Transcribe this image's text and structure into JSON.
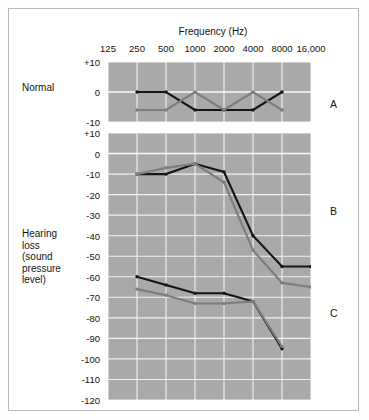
{
  "figure": {
    "background_color": "#ffffff",
    "plot_background_color": "#a9a9a9",
    "border_color": "#b9b9b9"
  },
  "labels": {
    "normal": "Normal",
    "hearing_loss_lines": [
      "Hearing",
      "loss",
      "(sound",
      "pressure",
      "level)"
    ],
    "panel_a": "A",
    "panel_b": "B",
    "panel_c": "C"
  },
  "chart_data": {
    "type": "line",
    "title": "",
    "xlabel": "Frequency (Hz)",
    "ylabel": "Hearing loss (sound pressure level)",
    "x_scale": "log",
    "grid": true,
    "legend": "none",
    "x": [
      125,
      250,
      500,
      1000,
      2000,
      4000,
      8000,
      16000
    ],
    "xtick_labels": [
      "125",
      "250",
      "500",
      "1000",
      "2000",
      "4000",
      "8000",
      "16,000"
    ],
    "series_colors": {
      "black": "#151515",
      "gray": "#7d7d7d"
    },
    "panels": [
      {
        "letter": "A",
        "row_label": "Normal",
        "ylim": [
          -10,
          10
        ],
        "ytick_labels": [
          "+10",
          "0",
          "-10"
        ],
        "ytick_values": [
          10,
          0,
          -10
        ],
        "series": [
          {
            "name": "black",
            "color": "#151515",
            "x": [
              250,
              500,
              1000,
              2000,
              4000,
              8000,
              16000
            ],
            "values": [
              0,
              0,
              -6,
              -6,
              -6,
              0,
              null
            ]
          },
          {
            "name": "gray",
            "color": "#7d7d7d",
            "x": [
              250,
              500,
              1000,
              2000,
              4000,
              8000,
              16000
            ],
            "values": [
              -6,
              -6,
              0,
              -6,
              0,
              -6,
              null
            ]
          }
        ]
      },
      {
        "letter": "B",
        "row_label": "",
        "ylim": [
          -120,
          10
        ],
        "ytick_labels": [
          "+10",
          "0",
          "-10",
          "-20",
          "-30",
          "-40",
          "-50",
          "-60",
          "-70",
          "-80",
          "-90",
          "-100",
          "-110",
          "-120"
        ],
        "ytick_values": [
          10,
          0,
          -10,
          -20,
          -30,
          -40,
          -50,
          -60,
          -70,
          -80,
          -90,
          -100,
          -110,
          -120
        ],
        "series": [
          {
            "name": "black",
            "color": "#151515",
            "x": [
              250,
              500,
              1000,
              2000,
              4000,
              8000,
              16000
            ],
            "values": [
              -10,
              -10,
              -5,
              -9,
              -40,
              -55,
              -55
            ]
          },
          {
            "name": "gray",
            "color": "#7d7d7d",
            "x": [
              250,
              500,
              1000,
              2000,
              4000,
              8000,
              16000
            ],
            "values": [
              -10,
              -7,
              -5,
              -14,
              -47,
              -63,
              -65
            ]
          }
        ]
      },
      {
        "letter": "C",
        "row_label": "",
        "ylim": [
          -120,
          10
        ],
        "ytick_labels": [],
        "ytick_values": [],
        "series": [
          {
            "name": "black",
            "color": "#151515",
            "x": [
              250,
              500,
              1000,
              2000,
              4000,
              8000,
              16000
            ],
            "values": [
              -60,
              -64,
              -68,
              -68,
              -72,
              -95,
              null
            ]
          },
          {
            "name": "gray",
            "color": "#7d7d7d",
            "x": [
              250,
              500,
              1000,
              2000,
              4000,
              8000,
              16000
            ],
            "values": [
              -66,
              -69,
              -73,
              -73,
              -72,
              -94,
              null
            ]
          }
        ]
      }
    ]
  }
}
